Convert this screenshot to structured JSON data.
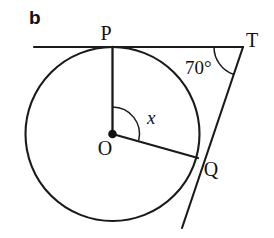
{
  "figure": {
    "part_label": "b",
    "background_color": "#ffffff",
    "stroke_color": "#1a1a1a",
    "points": {
      "P": {
        "label": "P",
        "x": 112.5,
        "y": 47
      },
      "T": {
        "label": "T",
        "x": 243,
        "y": 47
      },
      "Q": {
        "label": "Q",
        "x": 198,
        "y": 158
      },
      "O": {
        "label": "O",
        "x": 112.5,
        "y": 134
      }
    },
    "circle": {
      "center_x": 112.5,
      "center_y": 134,
      "radius": 87
    },
    "angles": {
      "at_T": {
        "label": "70°",
        "value": 70,
        "unit": "degrees"
      },
      "at_O": {
        "label": "x",
        "value": "x"
      }
    },
    "segments": {
      "tangent_top": {
        "from_x": 34,
        "from_y": 47,
        "to_x": 243,
        "to_y": 47
      },
      "tangent_right": {
        "from_x": 243,
        "from_y": 47,
        "to_x": 182,
        "to_y": 228
      },
      "radius_OP": {
        "from_x": 112.5,
        "from_y": 134,
        "to_x": 112.5,
        "to_y": 47
      },
      "radius_OQ": {
        "from_x": 112.5,
        "from_y": 134,
        "to_x": 198,
        "to_y": 158
      }
    }
  }
}
